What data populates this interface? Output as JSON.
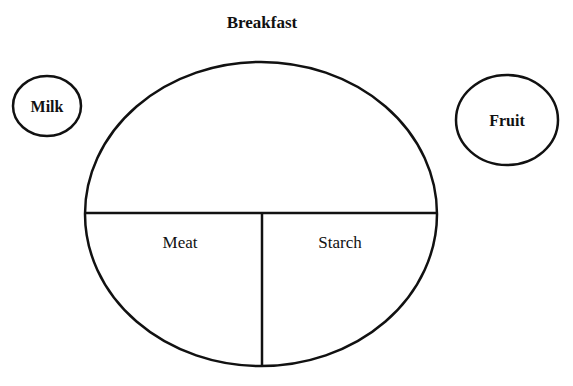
{
  "diagram": {
    "title": "Breakfast",
    "plate": {
      "sections": [
        {
          "label": "Meat"
        },
        {
          "label": "Starch"
        }
      ]
    },
    "side_items": [
      {
        "label": "Milk"
      },
      {
        "label": "Fruit"
      }
    ],
    "stroke_color": "#111111",
    "background": "#ffffff"
  }
}
